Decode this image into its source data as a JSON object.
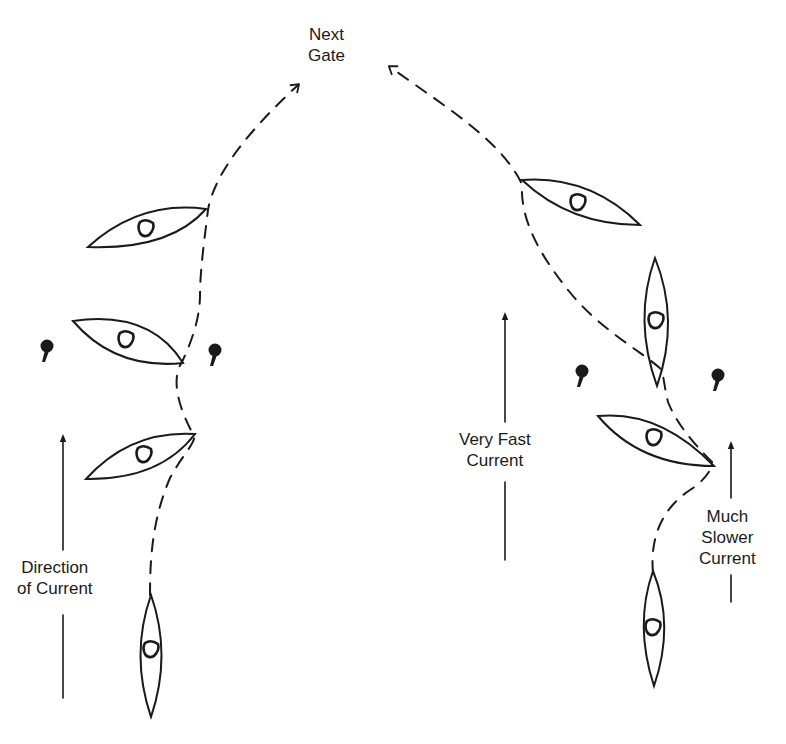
{
  "colors": {
    "ink": "#1a1a1a",
    "background": "#ffffff"
  },
  "labels": {
    "next_gate": {
      "line1": "Next",
      "line2": "Gate"
    },
    "direction_of_current": {
      "line1": "Direction",
      "line2": "of Current"
    },
    "very_fast_current": {
      "line1": "Very Fast",
      "line2": "Current"
    },
    "much_slower_current": {
      "line1": "Much",
      "line2": "Slower",
      "line3": "Current"
    }
  },
  "left_scenario": {
    "boats": [
      {
        "id": "start",
        "orientation": "vertical"
      },
      {
        "id": "below-gate",
        "orientation": "angled-right"
      },
      {
        "id": "in-gate",
        "orientation": "angled-left"
      },
      {
        "id": "above-gate",
        "orientation": "angled-right"
      }
    ],
    "gate_poles": 2,
    "path": "dashed, curving up through gate then toward Next Gate"
  },
  "right_scenario": {
    "boats": [
      {
        "id": "start",
        "orientation": "vertical"
      },
      {
        "id": "below-gate",
        "orientation": "angled-left"
      },
      {
        "id": "in-gate",
        "orientation": "vertical"
      },
      {
        "id": "above-gate",
        "orientation": "angled-left"
      }
    ],
    "gate_poles": 2,
    "path": "dashed, curving up through gate then toward Next Gate"
  }
}
